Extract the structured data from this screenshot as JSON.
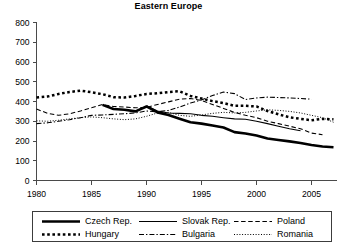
{
  "chart_data": {
    "type": "line",
    "title": "Eastern Europe",
    "xlabel": "",
    "ylabel": "",
    "xlim": [
      1980,
      2007
    ],
    "ylim": [
      0,
      800
    ],
    "grid": false,
    "legend_position": "bottom",
    "x_ticks": [
      "1980",
      "1985",
      "1990",
      "1995",
      "2000",
      "2005"
    ],
    "x_tick_values": [
      1980,
      1985,
      1990,
      1995,
      2000,
      2005
    ],
    "y_ticks": [
      "0",
      "100",
      "200",
      "300",
      "400",
      "500",
      "600",
      "700",
      "800"
    ],
    "y_tick_values": [
      0,
      100,
      200,
      300,
      400,
      500,
      600,
      700,
      800
    ],
    "x": [
      1980,
      1981,
      1982,
      1983,
      1984,
      1985,
      1986,
      1987,
      1988,
      1989,
      1990,
      1991,
      1992,
      1993,
      1994,
      1995,
      1996,
      1997,
      1998,
      1999,
      2000,
      2001,
      2002,
      2003,
      2004,
      2005,
      2006,
      2007
    ],
    "series": [
      {
        "name": "Czech Rep.",
        "style": "thick-solid",
        "x": [
          1986,
          1987,
          1988,
          1989,
          1990,
          1991,
          1992,
          1993,
          1994,
          1995,
          1996,
          1997,
          1998,
          1999,
          2000,
          2001,
          2002,
          2003,
          2004,
          2005,
          2006,
          2007
        ],
        "values": [
          383,
          362,
          358,
          350,
          375,
          345,
          332,
          313,
          295,
          288,
          278,
          268,
          245,
          238,
          228,
          213,
          205,
          198,
          190,
          180,
          172,
          168
        ]
      },
      {
        "name": "Hungary",
        "style": "thick-dotted",
        "x": [
          1980,
          1981,
          1982,
          1983,
          1984,
          1985,
          1986,
          1987,
          1988,
          1989,
          1990,
          1991,
          1992,
          1993,
          1994,
          1995,
          1996,
          1997,
          1998,
          1999,
          2000,
          2001,
          2002,
          2003,
          2004,
          2005,
          2006,
          2007
        ],
        "values": [
          420,
          425,
          438,
          448,
          455,
          447,
          437,
          422,
          420,
          428,
          438,
          442,
          448,
          452,
          428,
          415,
          402,
          392,
          378,
          378,
          375,
          352,
          335,
          320,
          312,
          305,
          312,
          310
        ],
        "note": "series ends near 2004 at about 310"
      },
      {
        "name": "Slovak Rep.",
        "style": "thin-solid",
        "x": [
          1990,
          1991,
          1992,
          1993,
          1994,
          1995,
          1996,
          1997,
          1998,
          1999,
          2000,
          2001,
          2002,
          2003,
          2004
        ],
        "values": [
          378,
          352,
          342,
          340,
          338,
          330,
          325,
          318,
          312,
          310,
          300,
          288,
          275,
          262,
          252
        ]
      },
      {
        "name": "Bulgaria",
        "style": "dash-dot",
        "x": [
          1980,
          1981,
          1982,
          1983,
          1984,
          1985,
          1986,
          1987,
          1988,
          1989,
          1990,
          1991,
          1992,
          1993,
          1994,
          1995,
          1996,
          1997,
          1998,
          1999,
          2000,
          2001,
          2002,
          2003,
          2004,
          2005
        ],
        "values": [
          288,
          292,
          300,
          308,
          318,
          330,
          332,
          335,
          338,
          342,
          352,
          348,
          355,
          372,
          392,
          408,
          430,
          448,
          440,
          410,
          418,
          422,
          420,
          418,
          415,
          412
        ]
      },
      {
        "name": "Poland",
        "style": "dashed",
        "x": [
          1980,
          1981,
          1982,
          1983,
          1984,
          1985,
          1986,
          1987,
          1988,
          1989,
          1990,
          1991,
          1992,
          1993,
          1994,
          1995,
          1996,
          1997,
          1998,
          1999,
          2000,
          2001,
          2002,
          2003,
          2004,
          2005,
          2006
        ],
        "values": [
          362,
          340,
          330,
          338,
          352,
          368,
          385,
          375,
          372,
          368,
          370,
          385,
          398,
          412,
          415,
          405,
          385,
          365,
          345,
          330,
          318,
          300,
          288,
          275,
          262,
          240,
          232
        ]
      },
      {
        "name": "Romania",
        "style": "fine-dotted",
        "x": [
          1980,
          1981,
          1982,
          1983,
          1984,
          1985,
          1986,
          1987,
          1988,
          1989,
          1990,
          1991,
          1992,
          1993,
          1994,
          1995,
          1996,
          1997,
          1998,
          1999,
          2000,
          2001,
          2002,
          2003,
          2004,
          2005,
          2006,
          2007
        ],
        "values": [
          302,
          300,
          305,
          312,
          318,
          322,
          318,
          312,
          308,
          312,
          325,
          342,
          345,
          330,
          325,
          332,
          340,
          345,
          342,
          345,
          352,
          358,
          355,
          350,
          342,
          330,
          318,
          295
        ]
      }
    ]
  },
  "legend": {
    "items": [
      {
        "label": "Czech Rep.",
        "style": "thick-solid"
      },
      {
        "label": "Slovak Rep.",
        "style": "thin-solid"
      },
      {
        "label": "Poland",
        "style": "dashed"
      },
      {
        "label": "Hungary",
        "style": "thick-dotted"
      },
      {
        "label": "Bulgaria",
        "style": "dash-dot"
      },
      {
        "label": "Romania",
        "style": "fine-dotted"
      }
    ]
  },
  "colors": {
    "line": "#000000",
    "axis": "#4a4a4a",
    "background": "#ffffff",
    "legend_border": "#3c3c3c"
  }
}
